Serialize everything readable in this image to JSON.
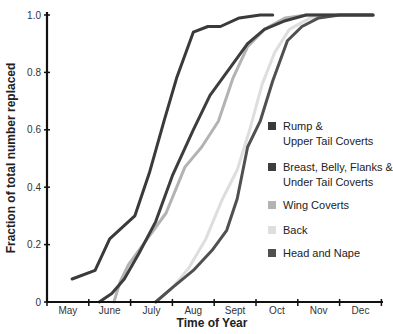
{
  "chart_data": {
    "type": "line",
    "title": "",
    "xlabel": "Time of Year",
    "ylabel": "Fraction of total number replaced",
    "x_tick_labels": [
      "May",
      "June",
      "July",
      "Aug",
      "Sept",
      "Oct",
      "Nov",
      "Dec"
    ],
    "y_tick_labels": [
      "0",
      "0.2",
      "0.4",
      "0.6",
      "0.8",
      "1.0"
    ],
    "y_ticks": [
      0,
      0.2,
      0.4,
      0.6,
      0.8,
      1.0
    ],
    "xlim": [
      0,
      8
    ],
    "ylim": [
      0,
      1.0
    ],
    "x_unit": "months since start of May",
    "grid": false,
    "legend_position": "right-inside",
    "series": [
      {
        "name": "Rump & Upper Tail Coverts",
        "legend_lines": [
          "Rump &",
          "Upper Tail Coverts"
        ],
        "color": "#3a3a3a",
        "points": [
          [
            0.6,
            0.08
          ],
          [
            1.15,
            0.11
          ],
          [
            1.5,
            0.22
          ],
          [
            2.1,
            0.3
          ],
          [
            2.45,
            0.45
          ],
          [
            2.8,
            0.63
          ],
          [
            3.1,
            0.78
          ],
          [
            3.5,
            0.94
          ],
          [
            3.85,
            0.96
          ],
          [
            4.15,
            0.96
          ],
          [
            4.6,
            0.99
          ],
          [
            5.1,
            1.0
          ],
          [
            5.4,
            1.0
          ]
        ]
      },
      {
        "name": "Breast, Belly, Flanks & Under Tail Coverts",
        "legend_lines": [
          "Breast, Belly, Flanks &",
          "Under Tail Coverts"
        ],
        "color": "#3d3d3d",
        "points": [
          [
            1.25,
            0.0
          ],
          [
            1.55,
            0.03
          ],
          [
            1.85,
            0.08
          ],
          [
            2.2,
            0.17
          ],
          [
            2.6,
            0.28
          ],
          [
            3.0,
            0.44
          ],
          [
            3.5,
            0.6
          ],
          [
            3.9,
            0.72
          ],
          [
            4.4,
            0.82
          ],
          [
            4.8,
            0.9
          ],
          [
            5.2,
            0.95
          ],
          [
            5.7,
            0.98
          ],
          [
            6.2,
            1.0
          ],
          [
            7.0,
            1.0
          ],
          [
            7.8,
            1.0
          ]
        ]
      },
      {
        "name": "Wing Coverts",
        "legend_lines": [
          "Wing Coverts"
        ],
        "color": "#b3b3b3",
        "points": [
          [
            1.6,
            0.0
          ],
          [
            1.75,
            0.07
          ],
          [
            1.95,
            0.13
          ],
          [
            2.4,
            0.22
          ],
          [
            2.85,
            0.31
          ],
          [
            3.3,
            0.47
          ],
          [
            3.7,
            0.54
          ],
          [
            4.1,
            0.63
          ],
          [
            4.45,
            0.78
          ],
          [
            4.8,
            0.89
          ],
          [
            5.2,
            0.95
          ],
          [
            5.7,
            0.99
          ],
          [
            6.2,
            1.0
          ],
          [
            7.0,
            1.0
          ],
          [
            7.8,
            1.0
          ]
        ]
      },
      {
        "name": "Back",
        "legend_lines": [
          "Back"
        ],
        "color": "#dedede",
        "points": [
          [
            2.6,
            0.0
          ],
          [
            3.0,
            0.05
          ],
          [
            3.4,
            0.12
          ],
          [
            3.8,
            0.22
          ],
          [
            4.2,
            0.36
          ],
          [
            4.55,
            0.46
          ],
          [
            4.85,
            0.6
          ],
          [
            5.15,
            0.76
          ],
          [
            5.45,
            0.87
          ],
          [
            5.8,
            0.95
          ],
          [
            6.3,
            0.99
          ],
          [
            7.0,
            1.0
          ],
          [
            7.8,
            1.0
          ]
        ]
      },
      {
        "name": "Head and Nape",
        "legend_lines": [
          "Head and Nape"
        ],
        "color": "#505050",
        "points": [
          [
            2.6,
            0.0
          ],
          [
            3.0,
            0.05
          ],
          [
            3.5,
            0.11
          ],
          [
            3.95,
            0.18
          ],
          [
            4.3,
            0.25
          ],
          [
            4.55,
            0.36
          ],
          [
            4.8,
            0.54
          ],
          [
            5.1,
            0.63
          ],
          [
            5.4,
            0.77
          ],
          [
            5.75,
            0.91
          ],
          [
            6.1,
            0.96
          ],
          [
            6.5,
            0.99
          ],
          [
            7.0,
            1.0
          ],
          [
            7.8,
            1.0
          ]
        ]
      }
    ]
  }
}
